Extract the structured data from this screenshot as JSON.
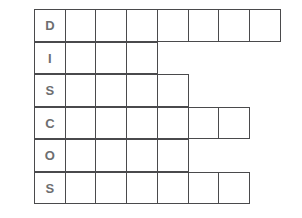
{
  "puzzle": {
    "type": "crossword-grid",
    "grid_origin_x": 34,
    "grid_origin_y": 10,
    "cell_width": 32,
    "cell_height": 32.5,
    "row_count": 6,
    "keyword": "DISCOS",
    "keyword_column_index": 0,
    "colors": {
      "border": "#4a4a4c",
      "letter": "#6d6e70",
      "number": "#58595b",
      "cell_fill": "#ffffff",
      "background": "#ffffff"
    },
    "rows": [
      {
        "number": "1.",
        "cell_count": 8,
        "letter": "D",
        "cells": [
          "D",
          "",
          "",
          "",
          "",
          "",
          "",
          ""
        ]
      },
      {
        "number": "2.",
        "cell_count": 4,
        "letter": "I",
        "cells": [
          "I",
          "",
          "",
          ""
        ]
      },
      {
        "number": "3.",
        "cell_count": 5,
        "letter": "S",
        "cells": [
          "S",
          "",
          "",
          "",
          ""
        ]
      },
      {
        "number": "4.",
        "cell_count": 7,
        "letter": "C",
        "cells": [
          "C",
          "",
          "",
          "",
          "",
          "",
          ""
        ]
      },
      {
        "number": "5.",
        "cell_count": 5,
        "letter": "O",
        "cells": [
          "O",
          "",
          "",
          "",
          ""
        ]
      },
      {
        "number": "6.",
        "cell_count": 7,
        "letter": "S",
        "cells": [
          "S",
          "",
          "",
          "",
          "",
          "",
          ""
        ]
      }
    ]
  }
}
